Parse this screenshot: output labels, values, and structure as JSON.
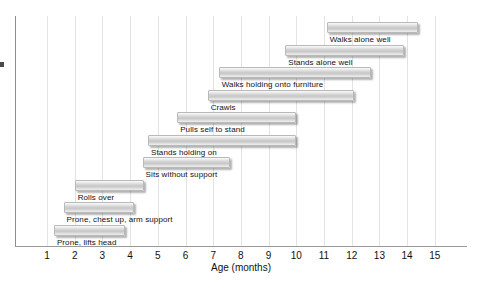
{
  "chart_data": {
    "type": "bar",
    "orientation": "horizontal-range",
    "title": "",
    "xlabel": "Age (months)",
    "ylabel": "",
    "xlim": [
      0.4,
      15.6
    ],
    "xticks": [
      1,
      2,
      3,
      4,
      5,
      6,
      7,
      8,
      9,
      10,
      11,
      12,
      13,
      14,
      15
    ],
    "grid": "vertical",
    "legend": "none",
    "categories": [
      "Prone, lifts head",
      "Prone, chest up, arm support",
      "Rolls over",
      "Sits without support",
      "Stands holding on",
      "Pulls self to stand",
      "Crawls",
      "Walks holding onto furniture",
      "Stands alone well",
      "Walks alone well"
    ],
    "bars": [
      {
        "label": "Walks alone well",
        "start": 11.1,
        "end": 14.4
      },
      {
        "label": "Stands alone well",
        "start": 9.6,
        "end": 13.9
      },
      {
        "label": "Walks holding onto furniture",
        "start": 7.2,
        "end": 12.7
      },
      {
        "label": "Crawls",
        "start": 6.8,
        "end": 12.1
      },
      {
        "label": "Pulls self to stand",
        "start": 5.7,
        "end": 10.0
      },
      {
        "label": "Stands holding on",
        "start": 4.65,
        "end": 10.0
      },
      {
        "label": "Sits without support",
        "start": 4.45,
        "end": 7.6
      },
      {
        "label": "Rolls over",
        "start": 2.0,
        "end": 4.5
      },
      {
        "label": "Prone, chest up, arm support",
        "start": 1.6,
        "end": 4.15
      },
      {
        "label": "Prone, lifts head",
        "start": 1.25,
        "end": 3.8
      }
    ],
    "colors": {
      "bar_fill_light": "#fbfbfb",
      "bar_fill_mid": "#c6c6c6",
      "bar_border": "#b9b9b9",
      "gridline": "#e3e3e3",
      "axis": "#8d8d8d",
      "text": "#111111"
    }
  },
  "axis": {
    "x_tick_labels": [
      "1",
      "2",
      "3",
      "4",
      "5",
      "6",
      "7",
      "8",
      "9",
      "10",
      "11",
      "12",
      "13",
      "14",
      "15"
    ],
    "x_axis_title": "Age (months)"
  }
}
